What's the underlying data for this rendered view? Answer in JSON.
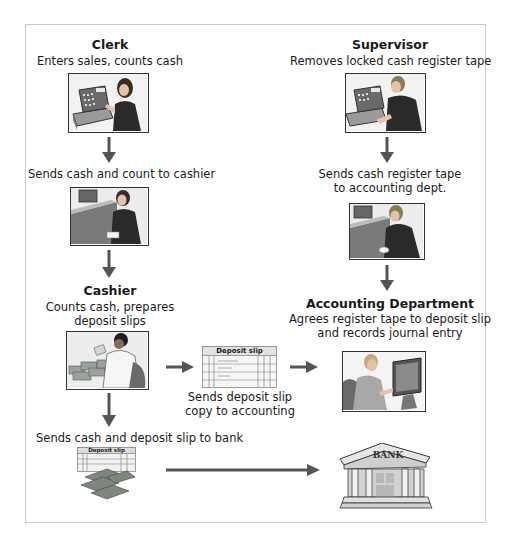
{
  "diagram": {
    "colors": {
      "arrow": "#555555",
      "frame_border": "#c8c8c8",
      "text": "#1a1a1a"
    },
    "nodes": {
      "clerk": {
        "title": "Clerk",
        "caption": "Enters sales, counts cash",
        "icon": "clerk-at-register-icon"
      },
      "clerk_send": {
        "caption": "Sends cash and count to cashier",
        "icon": "clerk-handing-cash-icon"
      },
      "cashier": {
        "title": "Cashier",
        "caption_line1": "Counts cash, prepares",
        "caption_line2": "deposit slips",
        "icon": "cashier-counting-cash-icon"
      },
      "deposit_copy": {
        "slip_label": "Deposit slip",
        "caption_line1": "Sends deposit slip",
        "caption_line2": "copy to accounting",
        "icon": "deposit-slip-icon"
      },
      "to_bank": {
        "caption": "Sends cash and deposit slip to bank",
        "slip_label": "Deposit slip",
        "icon": "deposit-slip-with-cash-icon"
      },
      "supervisor": {
        "title": "Supervisor",
        "caption": "Removes locked cash register tape",
        "icon": "supervisor-at-register-icon"
      },
      "supervisor_send": {
        "caption_line1": "Sends cash register tape",
        "caption_line2": "to accounting dept.",
        "icon": "supervisor-handing-tape-icon"
      },
      "accounting": {
        "title": "Accounting Department",
        "caption_line1": "Agrees register tape to deposit slip",
        "caption_line2": "and records journal entry",
        "icon": "accountant-at-computer-icon"
      },
      "bank": {
        "label": "BANK",
        "icon": "bank-building-icon"
      }
    },
    "edges": [
      {
        "from": "clerk",
        "to": "clerk_send"
      },
      {
        "from": "clerk_send",
        "to": "cashier"
      },
      {
        "from": "cashier",
        "to": "deposit_copy"
      },
      {
        "from": "deposit_copy",
        "to": "accounting"
      },
      {
        "from": "cashier",
        "to": "to_bank"
      },
      {
        "from": "to_bank",
        "to": "bank"
      },
      {
        "from": "supervisor",
        "to": "supervisor_send"
      },
      {
        "from": "supervisor_send",
        "to": "accounting"
      }
    ]
  }
}
